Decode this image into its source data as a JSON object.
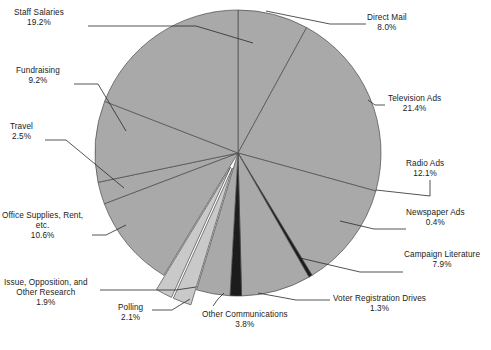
{
  "chart_data": {
    "type": "pie",
    "title": "",
    "subtitle": "",
    "xlabel": "",
    "ylabel": "",
    "legend_position": "none",
    "grid": false,
    "units": "percent",
    "start_angle_deg": 0,
    "direction": "clockwise",
    "total": 100.4,
    "categories": [
      "Direct Mail",
      "Television Ads",
      "Radio Ads",
      "Newspaper Ads",
      "Campaign Literature",
      "Voter Registration Drives",
      "Other Communications",
      "Polling",
      "Issue, Opposition, and Other Research",
      "Office Supplies, Rent, etc.",
      "Travel",
      "Fundraising",
      "Staff Salaries"
    ],
    "values": [
      8.0,
      21.4,
      12.1,
      0.4,
      7.9,
      1.3,
      3.8,
      2.1,
      1.9,
      10.6,
      2.5,
      9.2,
      19.2
    ],
    "slices": [
      {
        "label": "Direct Mail",
        "value": 8.0,
        "pct_text": "8.0%",
        "fill": "#a9a9a9",
        "exploded": false
      },
      {
        "label": "Television Ads",
        "value": 21.4,
        "pct_text": "21.4%",
        "fill": "#a9a9a9",
        "exploded": false
      },
      {
        "label": "Radio Ads",
        "value": 12.1,
        "pct_text": "12.1%",
        "fill": "#a9a9a9",
        "exploded": false
      },
      {
        "label": "Newspaper Ads",
        "value": 0.4,
        "pct_text": "0.4%",
        "fill": "#1c1c1c",
        "exploded": false
      },
      {
        "label": "Campaign Literature",
        "value": 7.9,
        "pct_text": "7.9%",
        "fill": "#a9a9a9",
        "exploded": false
      },
      {
        "label": "Voter Registration Drives",
        "value": 1.3,
        "pct_text": "1.3%",
        "fill": "#1c1c1c",
        "exploded": false
      },
      {
        "label": "Other Communications",
        "value": 3.8,
        "pct_text": "3.8%",
        "fill": "#a9a9a9",
        "exploded": false
      },
      {
        "label": "Polling",
        "value": 2.1,
        "pct_text": "2.1%",
        "fill": "#c9c9c9",
        "exploded": true
      },
      {
        "label": "Issue, Opposition, and Other Research",
        "value": 1.9,
        "pct_text": "1.9%",
        "fill": "#c9c9c9",
        "exploded": true
      },
      {
        "label": "Office Supplies, Rent, etc.",
        "value": 10.6,
        "pct_text": "10.6%",
        "fill": "#a9a9a9",
        "exploded": false
      },
      {
        "label": "Travel",
        "value": 2.5,
        "pct_text": "2.5%",
        "fill": "#a9a9a9",
        "exploded": false
      },
      {
        "label": "Fundraising",
        "value": 9.2,
        "pct_text": "9.2%",
        "fill": "#a9a9a9",
        "exploded": false
      },
      {
        "label": "Staff Salaries",
        "value": 19.2,
        "pct_text": "19.2%",
        "fill": "#a9a9a9",
        "exploded": false
      }
    ],
    "colors": {
      "slice_default": "#a9a9a9",
      "slice_dark": "#1c1c1c",
      "slice_light": "#c9c9c9",
      "outline": "#4a4a4a",
      "leader_line": "#2a2a2a",
      "background": "#ffffff"
    }
  },
  "labels": {
    "staff_salaries": {
      "name": "Staff Salaries",
      "pct": "19.2%"
    },
    "fundraising": {
      "name": "Fundraising",
      "pct": "9.2%"
    },
    "travel": {
      "name": "Travel",
      "pct": "2.5%"
    },
    "office_supplies": {
      "name_l1": "Office Supplies, Rent,",
      "name_l2": "etc.",
      "pct": "10.6%"
    },
    "issue_research": {
      "name_l1": "Issue, Opposition, and",
      "name_l2": "Other Research",
      "pct": "1.9%"
    },
    "polling": {
      "name": "Polling",
      "pct": "2.1%"
    },
    "other_comms": {
      "name": "Other Communications",
      "pct": "3.8%"
    },
    "voter_reg": {
      "name": "Voter Registration Drives",
      "pct": "1.3%"
    },
    "campaign_lit": {
      "name": "Campaign Literature",
      "pct": "7.9%"
    },
    "newspaper_ads": {
      "name": "Newspaper Ads",
      "pct": "0.4%"
    },
    "radio_ads": {
      "name": "Radio Ads",
      "pct": "12.1%"
    },
    "television_ads": {
      "name": "Television Ads",
      "pct": "21.4%"
    },
    "direct_mail": {
      "name": "Direct Mail",
      "pct": "8.0%"
    }
  },
  "caption": {
    "text": ""
  }
}
